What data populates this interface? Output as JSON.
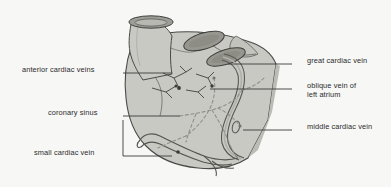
{
  "figure": {
    "background_color": "#f7f7f6",
    "organ_fill": "#c9c9c4",
    "organ_stroke": "#4a4a48",
    "vessel_stroke": "#585854",
    "dashed_vessel_stroke": "#8d8d88",
    "leader_color": "#3a3a38",
    "text_color": "#2b2b2b"
  },
  "labels": {
    "left": [
      {
        "id": "anterior-cardiac-veins",
        "text": "anterior cardiac veins",
        "x": 22,
        "y": 69,
        "leader_x1": 123,
        "leader_y1": 73,
        "leader_x2": 172,
        "leader_y2": 73
      },
      {
        "id": "coronary-sinus",
        "text": "coronary sinus",
        "x": 48,
        "y": 112,
        "leader_x1": 123,
        "leader_y1": 116,
        "leader_x2": 180,
        "leader_y2": 116
      },
      {
        "id": "small-cardiac-vein",
        "text": "small cardiac vein",
        "x": 34,
        "y": 152,
        "leader_x1": 123,
        "leader_y1": 156,
        "leader_x2": 172,
        "leader_y2": 156
      }
    ],
    "right": [
      {
        "id": "great-cardiac-vein",
        "text": "great cardiac vein",
        "x": 307,
        "y": 60,
        "leader_x1": 292,
        "leader_y1": 64,
        "leader_x2": 228,
        "leader_y2": 64
      },
      {
        "id": "oblique-vein-of-left-atrium",
        "text": "oblique vein of\nleft atrium",
        "line1": "oblique vein of",
        "line2": "left atrium",
        "x": 307,
        "y": 85,
        "leader_x1": 292,
        "leader_y1": 89,
        "leader_x2": 210,
        "leader_y2": 89
      },
      {
        "id": "middle-cardiac-vein",
        "text": "middle cardiac vein",
        "x": 307,
        "y": 126,
        "leader_x1": 292,
        "leader_y1": 130,
        "leader_x2": 243,
        "leader_y2": 130
      }
    ]
  },
  "structures": {
    "aorta": "great vessel trunk with cut cross-section at top",
    "vessel_stumps": [
      {
        "id": "vessel-stump-upper",
        "cx": 204,
        "cy": 41
      },
      {
        "id": "vessel-stump-lower",
        "cx": 224,
        "cy": 57
      },
      {
        "id": "aorta-cut-end",
        "cx": 143,
        "cy": 22
      }
    ]
  }
}
